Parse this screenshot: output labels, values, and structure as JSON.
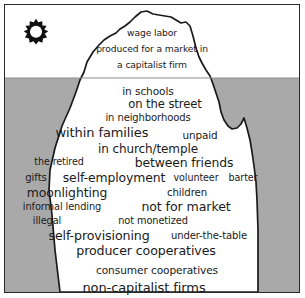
{
  "diagram": {
    "type": "iceberg",
    "sun_icon": "sun-icon",
    "colors": {
      "water": "#a9a9a9",
      "sky": "#ffffff",
      "iceberg": "#ffffff",
      "outline": "#1a1a1a",
      "border": "#2a2a2a",
      "text": "#1a1a1a"
    },
    "waterline_y": 78,
    "above_water": {
      "region_name": "capitalist-economy",
      "labels": [
        {
          "text": "wage labor",
          "x": 152,
          "y": 33,
          "size": 9.2
        },
        {
          "text": "produced for a market in",
          "x": 152,
          "y": 49,
          "size": 9.2
        },
        {
          "text": "a capitalist firm",
          "x": 152,
          "y": 65,
          "size": 9.2
        }
      ]
    },
    "below_water": {
      "region_name": "non-capitalist-economy",
      "labels": [
        {
          "text": "in schools",
          "x": 148,
          "y": 91,
          "size": 10.6
        },
        {
          "text": "on the street",
          "x": 165,
          "y": 105,
          "size": 11.6
        },
        {
          "text": "in neighborhoods",
          "x": 148,
          "y": 118,
          "size": 10.0
        },
        {
          "text": "within families",
          "x": 102,
          "y": 132,
          "size": 13.0
        },
        {
          "text": "unpaid",
          "x": 200,
          "y": 135,
          "size": 10.4
        },
        {
          "text": "in church/temple",
          "x": 148,
          "y": 149,
          "size": 12.0
        },
        {
          "text": "the retired",
          "x": 59,
          "y": 162,
          "size": 9.6
        },
        {
          "text": "between friends",
          "x": 184,
          "y": 163,
          "size": 12.4
        },
        {
          "text": "gifts",
          "x": 36,
          "y": 178,
          "size": 10.2
        },
        {
          "text": "self-employment",
          "x": 114,
          "y": 178,
          "size": 12.4
        },
        {
          "text": "volunteer",
          "x": 196,
          "y": 178,
          "size": 9.6
        },
        {
          "text": "barter",
          "x": 243,
          "y": 178,
          "size": 9.6
        },
        {
          "text": "moonlighting",
          "x": 67,
          "y": 193,
          "size": 12.4
        },
        {
          "text": "children",
          "x": 187,
          "y": 193,
          "size": 10.2
        },
        {
          "text": "informal lending",
          "x": 62,
          "y": 207,
          "size": 9.8
        },
        {
          "text": "not for market",
          "x": 186,
          "y": 207,
          "size": 12.6
        },
        {
          "text": "illegal",
          "x": 47,
          "y": 221,
          "size": 9.8
        },
        {
          "text": "not monetized",
          "x": 153,
          "y": 221,
          "size": 9.8
        },
        {
          "text": "self-provisioning",
          "x": 99,
          "y": 236,
          "size": 12.6
        },
        {
          "text": "under-the-table",
          "x": 209,
          "y": 236,
          "size": 10.0
        },
        {
          "text": "producer cooperatives",
          "x": 146,
          "y": 251,
          "size": 12.6
        },
        {
          "text": "consumer cooperatives",
          "x": 157,
          "y": 270,
          "size": 10.6
        },
        {
          "text": "non-capitalist firms",
          "x": 144,
          "y": 287,
          "size": 13.0
        }
      ]
    }
  }
}
